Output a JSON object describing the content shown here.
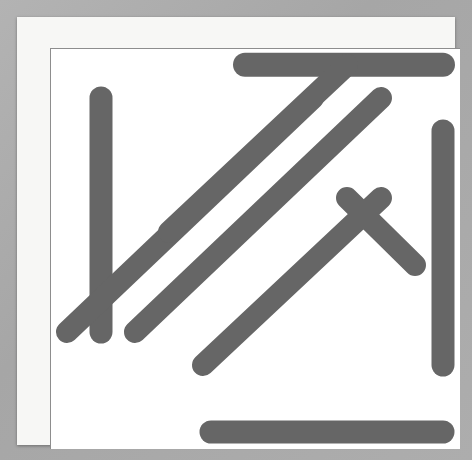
{
  "puzzle": {
    "type": "word-search",
    "rows": 12,
    "cols": 12,
    "grid": [
      [
        "M",
        "P",
        "L",
        "T",
        "D",
        "K",
        "O",
        "R",
        "P",
        "E",
        "L",
        "A"
      ],
      [
        "T",
        "P",
        "B",
        "C",
        "R",
        "L",
        "T",
        "N",
        "M",
        "Y",
        "X",
        "N"
      ],
      [
        "D",
        "E",
        "R",
        "W",
        "N",
        "D",
        "E",
        "K",
        "K",
        "P",
        "W",
        "N"
      ],
      [
        "C",
        "R",
        "H",
        "C",
        "C",
        "E",
        "R",
        "S",
        "M",
        "R",
        "S",
        "O"
      ],
      [
        "C",
        "C",
        "M",
        "W",
        "R",
        "V",
        "R",
        "P",
        "N",
        "P",
        "R",
        "R"
      ],
      [
        "C",
        "I",
        "Z",
        "G",
        "V",
        "O",
        "X",
        "B",
        "E",
        "A",
        "D",
        "A"
      ],
      [
        "Z",
        "V",
        "D",
        "J",
        "D",
        "R",
        "Q",
        "N",
        "K",
        "M",
        "Z",
        "M"
      ],
      [
        "X",
        "A",
        "Y",
        "A",
        "X",
        "T",
        "C",
        "M",
        "K",
        "L",
        "X",
        "E"
      ],
      [
        "P",
        "L",
        "Z",
        "T",
        "T",
        "E",
        "N",
        "F",
        "L",
        "W",
        "L",
        "L"
      ],
      [
        "Z",
        "L",
        "R",
        "V",
        "R",
        "B",
        "F",
        "M",
        "Z",
        "Q",
        "G",
        "C"
      ],
      [
        "K",
        "Z",
        "J",
        "H",
        "T",
        "Q",
        "N",
        "Q",
        "K",
        "T",
        "N",
        "N"
      ],
      [
        "Y",
        "F",
        "Z",
        "M",
        "S",
        "M",
        "A",
        "I",
        "L",
        "L",
        "I",
        "W"
      ]
    ],
    "found_words": [
      {
        "text": "KORPELA",
        "direction": "horizontal",
        "start_row": 1,
        "start_col": 6,
        "end_row": 1,
        "end_col": 12
      },
      {
        "text": "PERCIVAL",
        "direction": "vertical",
        "start_row": 2,
        "start_col": 2,
        "end_row": 9,
        "end_col": 2
      },
      {
        "text": "SMAILLIW",
        "direction": "horizontal-reversed",
        "start_row": 12,
        "start_col": 5,
        "end_row": 12,
        "end_col": 12
      },
      {
        "text": "NORAMELC",
        "direction": "vertical-reversed",
        "start_row": 3,
        "start_col": 12,
        "end_row": 10,
        "end_col": 12
      },
      {
        "text": "NEDERCVZ",
        "direction": "diagonal-down-left",
        "start_row": 2,
        "start_col": 8,
        "end_row": 9,
        "end_col": 1
      },
      {
        "text": "YKSRPOZE",
        "direction": "diagonal-down-left",
        "start_row": 2,
        "start_col": 10,
        "end_row": 9,
        "end_col": 3
      },
      {
        "text": "GRVCEDKC",
        "direction": "diagonal-up-right",
        "start_row": 6,
        "start_col": 4,
        "end_row": 1,
        "end_col": 9
      },
      {
        "text": "RENCQAZL",
        "direction": "diagonal-up-right",
        "start_row": 10,
        "start_col": 5,
        "end_row": 5,
        "end_col": 10
      },
      {
        "text": "NEKZ",
        "direction": "diagonal-down-right",
        "start_row": 5,
        "start_col": 9,
        "end_row": 7,
        "end_col": 11
      },
      {
        "text": "SPAM",
        "direction": "diagonal-down-left",
        "start_row": 4,
        "start_col": 11,
        "end_row": 7,
        "end_col": 8
      }
    ],
    "highlight_color": "#454545",
    "grid_line_color": "#8d8d8d",
    "letter_color": "#4a4a4a",
    "paper_color": "#f7f7f5",
    "background_color": "#a9a9a9"
  }
}
